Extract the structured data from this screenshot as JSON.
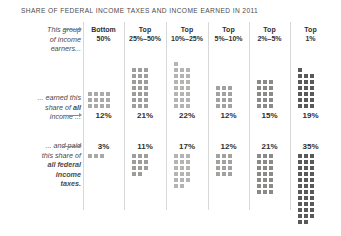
{
  "title": "SHARE OF FEDERAL INCOME TAXES AND INCOME EARNED IN 2011",
  "row_labels": {
    "group": {
      "line1": "This group",
      "line2": "of income",
      "line3": "earners..."
    },
    "income": {
      "line1": "... earned this",
      "line2a": "share of ",
      "line2b": "all",
      "line3": "income ..."
    },
    "taxes": {
      "line1": "... and paid",
      "line2": "this share of",
      "line3": "all federal",
      "line4": "income",
      "line5": "taxes."
    }
  },
  "columns": [
    {
      "head_line1": "Bottom",
      "head_line2": "50%",
      "income": "12%",
      "taxes": "3%"
    },
    {
      "head_line1": "Top",
      "head_line2": "25%–50%",
      "income": "21%",
      "taxes": "11%"
    },
    {
      "head_line1": "Top",
      "head_line2": "10%–25%",
      "income": "22%",
      "taxes": "17%"
    },
    {
      "head_line1": "Top",
      "head_line2": "5%–10%",
      "income": "12%",
      "taxes": "12%"
    },
    {
      "head_line1": "Top",
      "head_line2": "2%–5%",
      "income": "15%",
      "taxes": "21%"
    },
    {
      "head_line1": "Top",
      "head_line2": "1%",
      "income": "19%",
      "taxes": "35%"
    }
  ],
  "colors": {
    "shade_1": "#a9a9a7",
    "shade_2": "#9d9d9b",
    "shade_3": "#b4b4b2",
    "shade_4": "#a2a2a0",
    "shade_5": "#8a8a88",
    "shade_6": "#59595a",
    "background": "#ffffff",
    "divider": "#d8d8d6",
    "text": "#3a3a38"
  },
  "chart_data": {
    "type": "bar",
    "title": "SHARE OF FEDERAL INCOME TAXES AND INCOME EARNED IN 2011",
    "xlabel": "",
    "ylabel": "Share (%)",
    "categories": [
      "Bottom 50%",
      "Top 25%-50%",
      "Top 10%-25%",
      "Top 5%-10%",
      "Top 2%-5%",
      "Top 1%"
    ],
    "series": [
      {
        "name": "Share of all income earned",
        "values": [
          12,
          21,
          22,
          12,
          15,
          19
        ]
      },
      {
        "name": "Share of all federal income taxes paid",
        "values": [
          3,
          11,
          17,
          12,
          21,
          35
        ]
      }
    ],
    "unit": "percent",
    "note": "Each bar is drawn as a waffle grid of unit squares; one square = 1 percentage point.",
    "grid": false,
    "legend": "none"
  }
}
